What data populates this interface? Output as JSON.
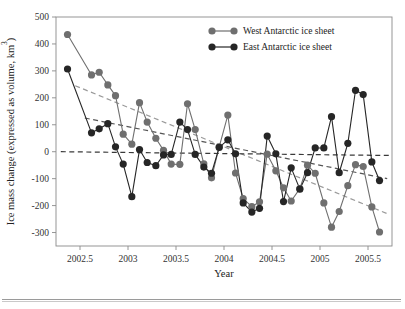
{
  "figure": {
    "background": "#ffffff",
    "plot_area": {
      "left": 56,
      "top": 17,
      "right": 392,
      "bottom": 246
    }
  },
  "axes": {
    "x_title": "Year",
    "y_title_parts": {
      "main": "Ice mass change (expressed as volume, km",
      "superscript": "3",
      "tail": ")"
    },
    "x_ticks": [
      "2002.5",
      "2003",
      "2003.5",
      "2004",
      "2004.5",
      "2005",
      "2005.5"
    ],
    "y_ticks": [
      "500",
      "400",
      "300",
      "200",
      "100",
      "0",
      "-100",
      "-200",
      "-300"
    ]
  },
  "legend": {
    "position": "top-right-inside",
    "entries": [
      {
        "label": "West Antarctic ice sheet",
        "color": "#6f6f6f",
        "marker": "circle"
      },
      {
        "label": "East Antarctic ice sheet",
        "color": "#262626",
        "marker": "circle"
      }
    ]
  },
  "colors": {
    "west": "#6f6f6f",
    "east": "#262626",
    "axis": "#8a8a8a",
    "text": "#222222",
    "zero_line": "#3a3a3a"
  },
  "chart_data": {
    "type": "line",
    "title": "",
    "xlabel": "Year",
    "ylabel": "Ice mass change (expressed as volume, km3)",
    "xlim": [
      2002.25,
      2005.75
    ],
    "ylim": [
      -350,
      500
    ],
    "xticks": [
      2002.5,
      2003,
      2003.5,
      2004,
      2004.5,
      2005,
      2005.5
    ],
    "yticks": [
      -300,
      -200,
      -100,
      0,
      100,
      200,
      300,
      400,
      500
    ],
    "grid": false,
    "legend_position": "upper right",
    "markers": "filled circle",
    "series": [
      {
        "name": "West Antarctic ice sheet",
        "color": "#6f6f6f",
        "x": [
          2002.37,
          2002.62,
          2002.7,
          2002.79,
          2002.87,
          2002.95,
          2003.04,
          2003.12,
          2003.2,
          2003.29,
          2003.37,
          2003.45,
          2003.54,
          2003.62,
          2003.7,
          2003.79,
          2003.87,
          2003.95,
          2004.04,
          2004.12,
          2004.2,
          2004.29,
          2004.37,
          2004.45,
          2004.54,
          2004.62,
          2004.7,
          2004.79,
          2004.87,
          2004.95,
          2005.04,
          2005.12,
          2005.2,
          2005.29,
          2005.37,
          2005.45,
          2005.54,
          2005.62
        ],
        "y": [
          435,
          285,
          295,
          248,
          208,
          65,
          28,
          182,
          110,
          50,
          5,
          -46,
          -47,
          178,
          82,
          -45,
          -97,
          18,
          136,
          -79,
          -174,
          -204,
          -186,
          -9,
          -71,
          -134,
          -183,
          -137,
          -50,
          -80,
          -190,
          -280,
          -222,
          -126,
          -48,
          -55,
          -205,
          -298
        ]
      },
      {
        "name": "East Antarctic ice sheet",
        "color": "#262626",
        "x": [
          2002.37,
          2002.62,
          2002.7,
          2002.79,
          2002.87,
          2002.95,
          2003.04,
          2003.12,
          2003.2,
          2003.29,
          2003.37,
          2003.45,
          2003.54,
          2003.62,
          2003.7,
          2003.79,
          2003.87,
          2003.95,
          2004.04,
          2004.12,
          2004.2,
          2004.29,
          2004.37,
          2004.45,
          2004.54,
          2004.62,
          2004.7,
          2004.79,
          2004.87,
          2004.95,
          2005.04,
          2005.12,
          2005.2,
          2005.29,
          2005.37,
          2005.45,
          2005.54,
          2005.62
        ],
        "y": [
          307,
          70,
          85,
          104,
          18,
          -46,
          -167,
          8,
          -40,
          -52,
          -12,
          -10,
          110,
          82,
          -10,
          -57,
          -80,
          16,
          44,
          -8,
          -190,
          -224,
          -210,
          58,
          -8,
          -185,
          -60,
          -139,
          -78,
          14,
          14,
          130,
          -78,
          31,
          228,
          212,
          -38,
          -107
        ]
      }
    ],
    "trend_lines": [
      {
        "name": "west-trend",
        "style": "dashed",
        "color": "#9a9a9a",
        "x": [
          2002.45,
          2005.7
        ],
        "y": [
          245,
          -230
        ]
      },
      {
        "name": "east-trend",
        "style": "dashed",
        "color": "#555555",
        "x": [
          2002.55,
          2005.7
        ],
        "y": [
          125,
          -100
        ]
      },
      {
        "name": "zero-reference",
        "style": "dashed",
        "color": "#3a3a3a",
        "x": [
          2002.3,
          2005.72
        ],
        "y": [
          0,
          -14
        ]
      }
    ]
  }
}
